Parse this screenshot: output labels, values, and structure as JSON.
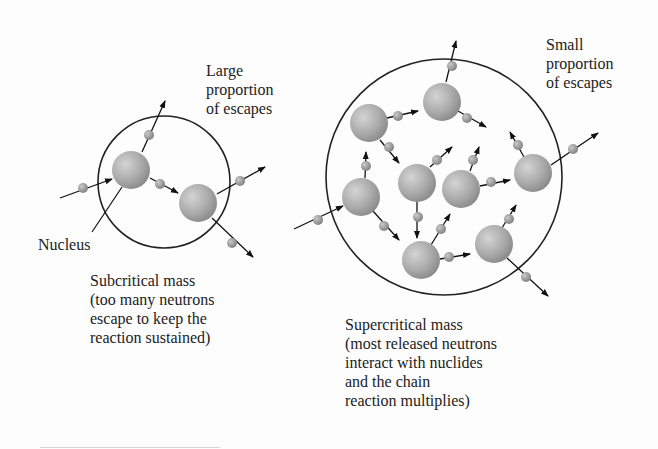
{
  "diagram": {
    "colors": {
      "background": "#fdfdfd",
      "outline": "#222222",
      "nucleus": "#a8a8a8",
      "neutron": "#9a9a9a",
      "text": "#222222"
    },
    "labels": {
      "large_escapes": [
        "Large",
        "proportion",
        "of escapes"
      ],
      "small_escapes": [
        "Small",
        "proportion",
        "of escapes"
      ],
      "nucleus": "Nucleus",
      "subcritical": [
        "Subcritical mass",
        "(too many neutrons",
        "escape to keep the",
        "reaction sustained)"
      ],
      "supercritical": [
        "Supercritical mass",
        "(most released neutrons",
        "interact with nuclides",
        "and the chain",
        "reaction multiplies)"
      ]
    },
    "subcritical": {
      "boundary": {
        "cx": 164,
        "cy": 182,
        "r": 66
      },
      "nuclei": [
        {
          "cx": 131,
          "cy": 170,
          "r": 19
        },
        {
          "cx": 198,
          "cy": 203,
          "r": 19
        }
      ],
      "neutrons": [
        {
          "cx": 83,
          "cy": 188,
          "r": 5
        },
        {
          "cx": 149,
          "cy": 135,
          "r": 5
        },
        {
          "cx": 160,
          "cy": 184,
          "r": 5
        },
        {
          "cx": 240,
          "cy": 181,
          "r": 5
        },
        {
          "cx": 232,
          "cy": 243,
          "r": 5
        }
      ],
      "arrows": [
        {
          "x1": 60,
          "y1": 198,
          "x2": 112,
          "y2": 179
        },
        {
          "x1": 142,
          "y1": 152,
          "x2": 165,
          "y2": 101
        },
        {
          "x1": 150,
          "y1": 178,
          "x2": 178,
          "y2": 193
        },
        {
          "x1": 217,
          "y1": 194,
          "x2": 265,
          "y2": 167
        },
        {
          "x1": 212,
          "y1": 218,
          "x2": 253,
          "y2": 257
        }
      ],
      "pointer": {
        "x1": 92,
        "y1": 232,
        "x2": 122,
        "y2": 187
      }
    },
    "supercritical": {
      "boundary": {
        "cx": 444,
        "cy": 177,
        "r": 118
      },
      "nuclei": [
        {
          "cx": 442,
          "cy": 102,
          "r": 19
        },
        {
          "cx": 369,
          "cy": 123,
          "r": 19
        },
        {
          "cx": 417,
          "cy": 183,
          "r": 19
        },
        {
          "cx": 461,
          "cy": 189,
          "r": 19
        },
        {
          "cx": 533,
          "cy": 173,
          "r": 19
        },
        {
          "cx": 361,
          "cy": 197,
          "r": 19
        },
        {
          "cx": 421,
          "cy": 260,
          "r": 19
        },
        {
          "cx": 494,
          "cy": 244,
          "r": 19
        }
      ],
      "neutrons": [
        {
          "cx": 452,
          "cy": 66,
          "r": 5
        },
        {
          "cx": 398,
          "cy": 116,
          "r": 5
        },
        {
          "cx": 467,
          "cy": 118,
          "r": 5
        },
        {
          "cx": 389,
          "cy": 147,
          "r": 5
        },
        {
          "cx": 366,
          "cy": 166,
          "r": 5
        },
        {
          "cx": 437,
          "cy": 160,
          "r": 5
        },
        {
          "cx": 473,
          "cy": 160,
          "r": 5
        },
        {
          "cx": 518,
          "cy": 145,
          "r": 5
        },
        {
          "cx": 573,
          "cy": 149,
          "r": 5
        },
        {
          "cx": 491,
          "cy": 182,
          "r": 5
        },
        {
          "cx": 318,
          "cy": 220,
          "r": 5
        },
        {
          "cx": 384,
          "cy": 226,
          "r": 5
        },
        {
          "cx": 418,
          "cy": 217,
          "r": 5
        },
        {
          "cx": 441,
          "cy": 229,
          "r": 5
        },
        {
          "cx": 449,
          "cy": 257,
          "r": 5
        },
        {
          "cx": 509,
          "cy": 219,
          "r": 5
        },
        {
          "cx": 526,
          "cy": 277,
          "r": 5
        }
      ],
      "arrows": [
        {
          "x1": 446,
          "y1": 82,
          "x2": 456,
          "y2": 41
        },
        {
          "x1": 387,
          "y1": 118,
          "x2": 418,
          "y2": 111
        },
        {
          "x1": 458,
          "y1": 111,
          "x2": 486,
          "y2": 127
        },
        {
          "x1": 380,
          "y1": 140,
          "x2": 399,
          "y2": 163
        },
        {
          "x1": 365,
          "y1": 178,
          "x2": 366,
          "y2": 152
        },
        {
          "x1": 430,
          "y1": 167,
          "x2": 452,
          "y2": 147
        },
        {
          "x1": 470,
          "y1": 171,
          "x2": 479,
          "y2": 147
        },
        {
          "x1": 524,
          "y1": 157,
          "x2": 510,
          "y2": 132
        },
        {
          "x1": 551,
          "y1": 165,
          "x2": 598,
          "y2": 133
        },
        {
          "x1": 480,
          "y1": 186,
          "x2": 510,
          "y2": 180
        },
        {
          "x1": 294,
          "y1": 229,
          "x2": 343,
          "y2": 206
        },
        {
          "x1": 373,
          "y1": 211,
          "x2": 399,
          "y2": 240
        },
        {
          "x1": 417,
          "y1": 202,
          "x2": 417,
          "y2": 238
        },
        {
          "x1": 431,
          "y1": 245,
          "x2": 450,
          "y2": 214
        },
        {
          "x1": 440,
          "y1": 259,
          "x2": 470,
          "y2": 254
        },
        {
          "x1": 502,
          "y1": 228,
          "x2": 516,
          "y2": 205
        },
        {
          "x1": 507,
          "y1": 258,
          "x2": 548,
          "y2": 296
        }
      ]
    }
  }
}
